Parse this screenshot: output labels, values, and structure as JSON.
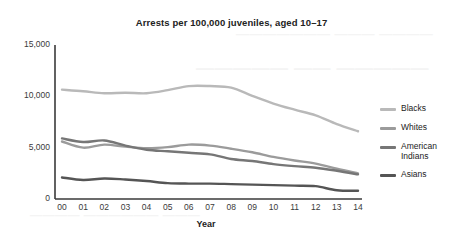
{
  "chart_data": {
    "type": "line",
    "title": "Arrests per 100,000 juveniles, aged 10–17",
    "xlabel": "Year",
    "ylabel": "",
    "categories": [
      "00",
      "01",
      "02",
      "03",
      "04",
      "05",
      "06",
      "07",
      "08",
      "09",
      "10",
      "11",
      "12",
      "13",
      "14"
    ],
    "ylim": [
      0,
      15000
    ],
    "yticks": [
      0,
      5000,
      10000,
      15000
    ],
    "ytick_labels": [
      "0",
      "5,000",
      "10,000",
      "15,000"
    ],
    "grid": false,
    "legend_position": "right",
    "series": [
      {
        "name": "Blacks",
        "color": "#b9b9b9",
        "values": [
          10650,
          10500,
          10300,
          10350,
          10300,
          10600,
          11000,
          11000,
          10850,
          10050,
          9300,
          8700,
          8150,
          7300,
          6600
        ]
      },
      {
        "name": "Whites",
        "color": "#9b9b9b",
        "values": [
          5600,
          5000,
          5300,
          5100,
          4950,
          5050,
          5300,
          5200,
          4900,
          4550,
          4100,
          3750,
          3450,
          2950,
          2500
        ]
      },
      {
        "name": "American Indians",
        "color": "#767676",
        "values": [
          5900,
          5550,
          5700,
          5200,
          4800,
          4650,
          4500,
          4350,
          3900,
          3700,
          3400,
          3200,
          3050,
          2750,
          2400
        ]
      },
      {
        "name": "Asians",
        "color": "#555555",
        "values": [
          2100,
          1850,
          2000,
          1900,
          1750,
          1550,
          1500,
          1500,
          1450,
          1400,
          1350,
          1300,
          1250,
          850,
          800
        ]
      }
    ]
  },
  "ghost_text": {
    "line1": "——————— ——— ————",
    "line2": "————— —— —————",
    "line3": "———— —————— ———"
  }
}
